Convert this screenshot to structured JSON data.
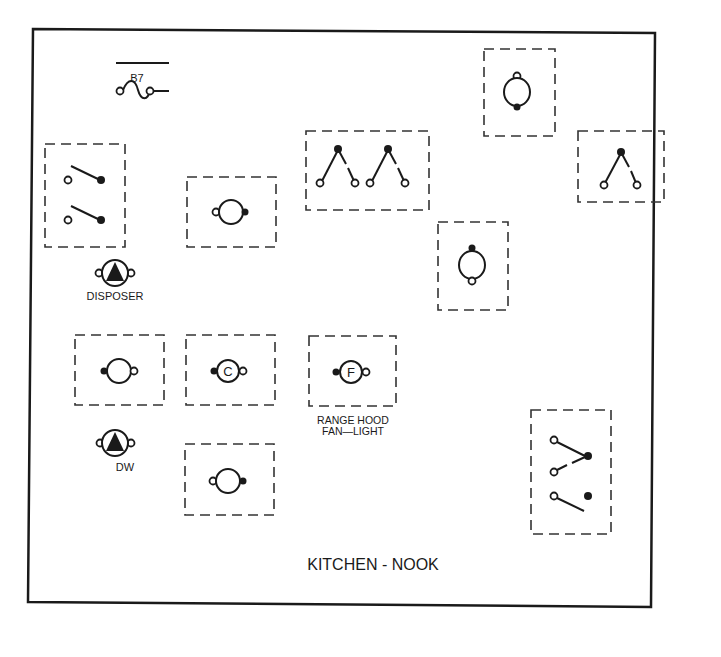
{
  "diagram": {
    "title": "KITCHEN - NOOK",
    "circuit_label": "B7",
    "labels": {
      "disposer": "DISPOSER",
      "dishwasher": "DW",
      "range_hood_line1": "RANGE HOOD",
      "range_hood_line2": "FAN—LIGHT"
    },
    "symbols": {
      "ceiling_fan": "C",
      "fan": "F"
    },
    "colors": {
      "line": "#1a1a1a",
      "background": "#ffffff"
    }
  }
}
